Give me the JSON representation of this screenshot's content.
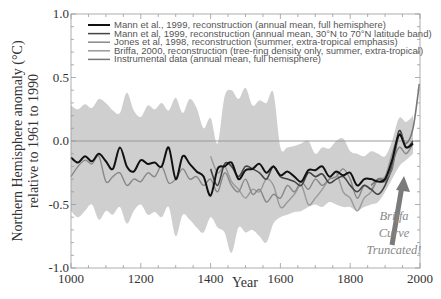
{
  "chart_data": {
    "type": "line",
    "title": "",
    "xlabel": "Year",
    "ylabel": "Northern Hemisphere anomaly (°C)",
    "ylabel_line2": "relative to 1961 to 1990",
    "xlim": [
      1000,
      2000
    ],
    "ylim": [
      -1.0,
      1.0
    ],
    "x_ticks": [
      "1000",
      "1200",
      "1400",
      "1600",
      "1800",
      "2000"
    ],
    "y_ticks": [
      "1.0",
      "0.5",
      "0.0",
      "-0.5",
      "-1.0"
    ],
    "grid": false,
    "legend_position": "upper left",
    "legend": [
      {
        "label": "Mann et al., 1999, reconstruction (annual mean, full hemisphere)",
        "color": "#111111"
      },
      {
        "label": "Mann et al, 1999, reconstruction (annual mean, 30°N to 70°N latitude band)",
        "color": "#444444"
      },
      {
        "label": "Jones et al, 1998, reconstruction (summer, extra-tropical emphasis)",
        "color": "#888888"
      },
      {
        "label": "Briffa, 2000, reconstruction (tree-ring density only, summer, extra-tropical)",
        "color": "#999999"
      },
      {
        "label": "Instrumental data (annual mean, full hemisphere)",
        "color": "#777777"
      }
    ],
    "uncertainty_band": {
      "x": [
        1000,
        1020,
        1040,
        1060,
        1080,
        1100,
        1120,
        1140,
        1160,
        1180,
        1200,
        1220,
        1240,
        1260,
        1280,
        1300,
        1320,
        1340,
        1360,
        1380,
        1400,
        1420,
        1440,
        1460,
        1480,
        1500,
        1520,
        1540,
        1560,
        1580,
        1600,
        1620,
        1640,
        1660,
        1680,
        1700,
        1720,
        1740,
        1760,
        1780,
        1800,
        1820,
        1840,
        1860,
        1880,
        1900,
        1920,
        1940,
        1960,
        1980
      ],
      "upper": [
        0.28,
        0.25,
        0.29,
        0.26,
        0.33,
        0.3,
        0.24,
        0.22,
        0.38,
        0.24,
        0.19,
        0.28,
        0.25,
        0.3,
        0.24,
        0.34,
        0.22,
        0.33,
        0.26,
        0.1,
        0.18,
        -0.02,
        0.35,
        0.4,
        0.33,
        0.42,
        0.28,
        0.32,
        0.3,
        0.38,
        -0.05,
        -0.05,
        -0.04,
        -0.02,
        0.0,
        -0.1,
        -0.05,
        -0.06,
        0.0,
        0.02,
        -0.08,
        -0.1,
        -0.12,
        -0.08,
        -0.1,
        -0.12,
        0.0,
        0.18,
        0.15,
        0.2
      ],
      "lower": [
        -0.55,
        -0.6,
        -0.55,
        -0.5,
        -0.62,
        -0.55,
        -0.58,
        -0.52,
        -0.65,
        -0.55,
        -0.5,
        -0.58,
        -0.56,
        -0.6,
        -0.52,
        -0.75,
        -0.58,
        -0.62,
        -0.68,
        -0.72,
        -0.6,
        -0.68,
        -0.72,
        -0.88,
        -0.68,
        -0.72,
        -0.7,
        -0.75,
        -0.8,
        -0.65,
        -0.6,
        -0.58,
        -0.56,
        -0.55,
        -0.52,
        -0.5,
        -0.52,
        -0.48,
        -0.5,
        -0.52,
        -0.52,
        -0.55,
        -0.52,
        -0.5,
        -0.48,
        -0.4,
        -0.3,
        -0.2,
        -0.15,
        -0.1
      ]
    },
    "series": [
      {
        "name": "Mann et al., 1999 (full hemisphere)",
        "x": [
          1000,
          1020,
          1040,
          1060,
          1080,
          1100,
          1120,
          1140,
          1160,
          1180,
          1200,
          1220,
          1240,
          1260,
          1280,
          1300,
          1320,
          1340,
          1360,
          1380,
          1400,
          1420,
          1440,
          1460,
          1480,
          1500,
          1520,
          1540,
          1560,
          1580,
          1600,
          1620,
          1640,
          1660,
          1680,
          1700,
          1720,
          1740,
          1760,
          1780,
          1800,
          1820,
          1840,
          1860,
          1880,
          1900,
          1920,
          1940,
          1960,
          1980
        ],
        "values": [
          -0.13,
          -0.17,
          -0.12,
          -0.16,
          -0.1,
          -0.16,
          -0.22,
          -0.05,
          -0.2,
          -0.24,
          -0.15,
          -0.18,
          -0.17,
          -0.2,
          -0.05,
          -0.3,
          -0.12,
          -0.18,
          -0.24,
          -0.28,
          -0.43,
          -0.22,
          -0.2,
          -0.17,
          -0.3,
          -0.23,
          -0.22,
          -0.18,
          -0.25,
          -0.2,
          -0.27,
          -0.24,
          -0.28,
          -0.32,
          -0.23,
          -0.23,
          -0.2,
          -0.28,
          -0.24,
          -0.27,
          -0.25,
          -0.35,
          -0.3,
          -0.3,
          -0.32,
          -0.3,
          -0.15,
          0.05,
          -0.05,
          -0.02
        ]
      },
      {
        "name": "Mann et al, 1999 (30°N to 70°N)",
        "x": [
          1400,
          1420,
          1440,
          1460,
          1480,
          1500,
          1520,
          1540,
          1560,
          1580,
          1600,
          1620,
          1640,
          1660,
          1680,
          1700,
          1720,
          1740,
          1760,
          1780,
          1800,
          1820,
          1840,
          1860,
          1880,
          1900,
          1920,
          1940,
          1960,
          1980
        ],
        "values": [
          -0.22,
          -0.35,
          -0.18,
          -0.2,
          -0.28,
          -0.2,
          -0.22,
          -0.25,
          -0.3,
          -0.2,
          -0.28,
          -0.3,
          -0.32,
          -0.35,
          -0.25,
          -0.28,
          -0.26,
          -0.33,
          -0.3,
          -0.28,
          -0.35,
          -0.4,
          -0.35,
          -0.38,
          -0.42,
          -0.35,
          -0.2,
          0.08,
          -0.05,
          0.0
        ]
      },
      {
        "name": "Jones et al, 1998",
        "x": [
          1000,
          1020,
          1040,
          1060,
          1080,
          1100,
          1120,
          1140,
          1160,
          1180,
          1200,
          1220,
          1240,
          1260,
          1280,
          1300,
          1320,
          1340,
          1360,
          1380,
          1400,
          1420,
          1440,
          1460,
          1480,
          1500,
          1520,
          1540,
          1560,
          1580,
          1600,
          1620,
          1640,
          1660,
          1680,
          1700,
          1720,
          1740,
          1760,
          1780,
          1800,
          1820,
          1840,
          1860,
          1880,
          1900,
          1920,
          1940,
          1960,
          1980
        ],
        "values": [
          -0.28,
          -0.2,
          -0.15,
          -0.18,
          -0.12,
          -0.32,
          -0.28,
          -0.25,
          -0.35,
          -0.3,
          -0.32,
          -0.25,
          -0.28,
          -0.2,
          -0.33,
          -0.3,
          -0.22,
          -0.3,
          -0.28,
          -0.35,
          -0.3,
          -0.4,
          -0.25,
          -0.35,
          -0.4,
          -0.3,
          -0.42,
          -0.38,
          -0.48,
          -0.42,
          -0.45,
          -0.35,
          -0.4,
          -0.32,
          -0.38,
          -0.3,
          -0.35,
          -0.3,
          -0.28,
          -0.22,
          -0.3,
          -0.45,
          -0.35,
          -0.38,
          -0.3,
          -0.32,
          -0.18,
          -0.05,
          -0.1,
          -0.02
        ]
      },
      {
        "name": "Briffa, 2000",
        "x": [
          1400,
          1420,
          1440,
          1460,
          1480,
          1500,
          1520,
          1540,
          1560,
          1580,
          1600,
          1620,
          1640,
          1660,
          1680,
          1700,
          1720,
          1740,
          1760,
          1780,
          1800,
          1820,
          1840,
          1860,
          1880,
          1900,
          1920,
          1940,
          1960
        ],
        "values": [
          -0.12,
          -0.25,
          -0.2,
          -0.32,
          -0.38,
          -0.45,
          -0.38,
          -0.4,
          -0.3,
          -0.35,
          -0.52,
          -0.48,
          -0.42,
          -0.35,
          -0.5,
          -0.45,
          -0.38,
          -0.3,
          -0.25,
          -0.4,
          -0.45,
          -0.55,
          -0.45,
          -0.4,
          -0.3,
          -0.28,
          -0.1,
          0.05,
          -0.05
        ]
      },
      {
        "name": "Instrumental data",
        "x": [
          1860,
          1880,
          1900,
          1920,
          1940,
          1960,
          1980,
          1998
        ],
        "values": [
          -0.35,
          -0.3,
          -0.3,
          -0.22,
          0.05,
          -0.02,
          0.1,
          0.45
        ]
      }
    ],
    "annotations": [
      {
        "text": "Briffa",
        "x": 1960,
        "y": -0.75
      },
      {
        "text": "Curve",
        "x": 1960,
        "y": -0.85
      },
      {
        "text": "Truncated!",
        "x": 1960,
        "y": -0.95
      }
    ]
  }
}
